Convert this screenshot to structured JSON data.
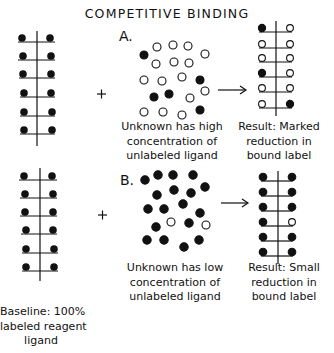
{
  "title": "COMPETITIVE BINDING",
  "panels": {
    "a": {
      "letter": "A.",
      "unknown_caption": [
        "Unknown has high",
        "concentration of",
        "unlabeled ligand"
      ],
      "result_caption": [
        "Result: Marked",
        "reduction in",
        "bound label"
      ],
      "result_rows": [
        [
          "filled",
          "open"
        ],
        [
          "open",
          "open"
        ],
        [
          "open",
          "open"
        ],
        [
          "filled",
          "open"
        ],
        [
          "open",
          "open"
        ],
        [
          "open",
          "filled"
        ]
      ]
    },
    "b": {
      "letter": "B.",
      "unknown_caption": [
        "Unknown has low",
        "concentration of",
        "unlabeled ligand"
      ],
      "result_caption": [
        "Result: Small",
        "reduction in",
        "bound label"
      ],
      "result_rows": [
        [
          "filled",
          "filled"
        ],
        [
          "filled",
          "filled"
        ],
        [
          "filled",
          "filled"
        ],
        [
          "filled",
          "open"
        ],
        [
          "filled",
          "filled"
        ],
        [
          "filled",
          "filled"
        ]
      ]
    }
  },
  "baseline_caption": [
    "Baseline: 100%",
    "labeled reagent",
    "ligand"
  ],
  "plus_symbol": "+",
  "legend_semantics": {
    "filled": "labeled ligand",
    "open": "unlabeled ligand"
  }
}
